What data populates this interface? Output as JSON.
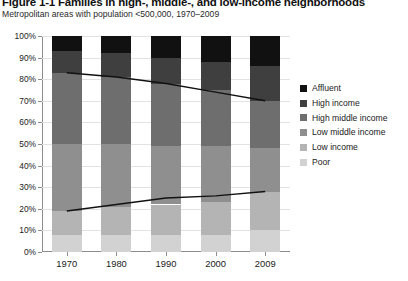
{
  "figure": {
    "title": "Figure 1-1 Families in high-, middle-, and low-income neighborhoods",
    "subtitle": "Metropolitan areas with population <500,000, 1970–2009"
  },
  "legend": {
    "position": "right",
    "items": [
      {
        "label": "Affluent",
        "color": "#111111"
      },
      {
        "label": "High income",
        "color": "#3f3f3f"
      },
      {
        "label": "High middle income",
        "color": "#6e6e6e"
      },
      {
        "label": "Low middle income",
        "color": "#8f8f8f"
      },
      {
        "label": "Low income",
        "color": "#b4b4b4"
      },
      {
        "label": "Poor",
        "color": "#d2d2d2"
      }
    ]
  },
  "axes": {
    "y_ticks": [
      "0%",
      "10%",
      "20%",
      "30%",
      "40%",
      "50%",
      "60%",
      "70%",
      "80%",
      "90%",
      "100%"
    ],
    "x_ticks": [
      "1970",
      "1980",
      "1990",
      "2000",
      "2009"
    ]
  },
  "chart_data": {
    "type": "bar",
    "title": "Figure 1-1 Families in high-, middle-, and low-income neighborhoods",
    "subtitle": "Metropolitan areas with population <500,000, 1970–2009",
    "stacked": true,
    "stack_total": 100,
    "xlabel": "",
    "ylabel": "",
    "ylim": [
      0,
      100
    ],
    "ytick_values": [
      0,
      10,
      20,
      30,
      40,
      50,
      60,
      70,
      80,
      90,
      100
    ],
    "grid": true,
    "legend_position": "right",
    "categories": [
      "1970",
      "1980",
      "1990",
      "2000",
      "2009"
    ],
    "series": [
      {
        "name": "Affluent",
        "color": "#111111",
        "values": [
          7,
          8,
          10,
          12,
          14
        ]
      },
      {
        "name": "High income",
        "color": "#3f3f3f",
        "values": [
          10,
          11,
          12,
          13,
          16
        ]
      },
      {
        "name": "High middle income",
        "color": "#6e6e6e",
        "values": [
          33,
          31,
          29,
          26,
          22
        ]
      },
      {
        "name": "Low middle income",
        "color": "#8f8f8f",
        "values": [
          31,
          29,
          27,
          26,
          20
        ]
      },
      {
        "name": "Low income",
        "color": "#b4b4b4",
        "values": [
          11,
          13,
          14,
          15,
          18
        ]
      },
      {
        "name": "Poor",
        "color": "#d2d2d2",
        "values": [
          8,
          8,
          8,
          8,
          10
        ]
      }
    ],
    "overlay_lines": [
      {
        "name": "upper-trend",
        "color": "#111111",
        "x": [
          "1970",
          "1980",
          "1990",
          "2000",
          "2009"
        ],
        "values": [
          83,
          81,
          78,
          74,
          70
        ]
      },
      {
        "name": "lower-trend",
        "color": "#111111",
        "x": [
          "1970",
          "1980",
          "1990",
          "2000",
          "2009"
        ],
        "values": [
          19,
          22,
          25,
          26,
          28
        ]
      }
    ]
  }
}
